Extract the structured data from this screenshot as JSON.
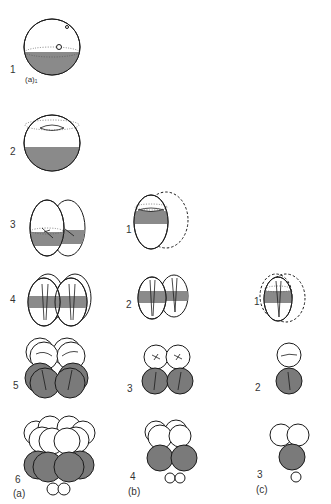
{
  "figure": {
    "columns": [
      {
        "id": "a",
        "label": "(a)"
      },
      {
        "id": "b",
        "label": "(b)"
      },
      {
        "id": "c",
        "label": "(c)"
      }
    ],
    "column_a": {
      "sub_label": "(a)₁",
      "stages": [
        "1",
        "2",
        "3",
        "4",
        "5",
        "6"
      ]
    },
    "column_b": {
      "stages": [
        "1",
        "2",
        "3",
        "4"
      ]
    },
    "column_c": {
      "stages": [
        "1",
        "2",
        "3"
      ]
    }
  },
  "colors": {
    "outline": "#1a1a1a",
    "shaded": "#7a7a7a",
    "background": "#ffffff",
    "label": "#333333"
  }
}
